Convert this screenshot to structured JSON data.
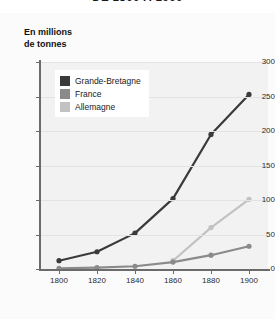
{
  "title": "DE 1800 À 1900",
  "axis_caption": [
    "En millions",
    "de tonnes"
  ],
  "legend": {
    "items": [
      {
        "label": "Grande-Bretagne",
        "color": "#3a3a3a"
      },
      {
        "label": "France",
        "color": "#8a8a8a"
      },
      {
        "label": "Allemagne",
        "color": "#c2c2c2"
      }
    ]
  },
  "chart_data": {
    "type": "line",
    "title": "DE 1800 À 1900",
    "xlabel": "",
    "ylabel": "En millions de tonnes",
    "x": [
      1800,
      1820,
      1840,
      1860,
      1880,
      1900
    ],
    "xtick_labels": [
      "1800",
      "1820",
      "1840",
      "1860",
      "1880",
      "1900"
    ],
    "ytick_labels": [
      "0",
      "50",
      "100",
      "150",
      "200",
      "250",
      "300"
    ],
    "yticks": [
      0,
      50,
      100,
      150,
      200,
      250,
      300
    ],
    "xlim": [
      1790,
      1910
    ],
    "ylim": [
      0,
      300
    ],
    "grid": true,
    "legend_position": "upper-left",
    "series": [
      {
        "name": "Grande-Bretagne",
        "color": "#3a3a3a",
        "x": [
          1800,
          1820,
          1840,
          1860,
          1880,
          1900
        ],
        "values": [
          12,
          25,
          52,
          102,
          195,
          253
        ]
      },
      {
        "name": "France",
        "color": "#8a8a8a",
        "x": [
          1800,
          1820,
          1840,
          1860,
          1880,
          1900
        ],
        "values": [
          1,
          2,
          4,
          10,
          20,
          33
        ]
      },
      {
        "name": "Allemagne",
        "color": "#c2c2c2",
        "x": [
          1860,
          1880,
          1900
        ],
        "values": [
          12,
          60,
          101
        ]
      }
    ]
  }
}
